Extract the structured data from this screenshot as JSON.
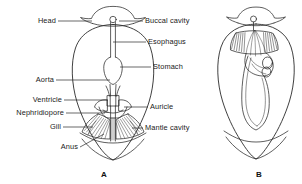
{
  "figure": {
    "background_color": "#ffffff",
    "line_color": "#2a2a2a",
    "text_color": "#1a1a1a"
  },
  "panels": [
    {
      "id": "A",
      "letter": "A",
      "caption": "A",
      "x": 101,
      "y": 171
    },
    {
      "id": "B",
      "letter": "B",
      "caption": "B",
      "x": 256,
      "y": 171
    }
  ],
  "labels_left": [
    {
      "name": "head",
      "text": "Head",
      "x": 31,
      "y": 18,
      "line_from_x": 58,
      "line_to_x": 92,
      "line_y": 21
    },
    {
      "name": "aorta",
      "text": "Aorta",
      "x": 29,
      "y": 77,
      "line_from_x": 56,
      "line_to_x": 110,
      "line_y": 80
    },
    {
      "name": "ventricle",
      "text": "Ventricle",
      "x": 19,
      "y": 97,
      "line_from_x": 62,
      "line_to_x": 108,
      "line_y": 100
    },
    {
      "name": "nephridiopore",
      "text": "Nephridiopore",
      "x": 2,
      "y": 110,
      "line_from_x": 64,
      "line_to_x": 104,
      "line_y": 113
    },
    {
      "name": "gill",
      "text": "Gill",
      "x": 48,
      "y": 124,
      "line_from_x": 63,
      "line_to_x": 92,
      "line_y": 127
    },
    {
      "name": "anus",
      "text": "Anus",
      "x": 56,
      "y": 144,
      "line_from_x": 80,
      "line_to_x": 110,
      "line_y": 147
    }
  ],
  "labels_right": [
    {
      "name": "buccal-cavity",
      "text": "Buccal cavity",
      "x": 145,
      "y": 18,
      "line_from_x": 119,
      "line_to_x": 143,
      "line_y": 21
    },
    {
      "name": "esophagus",
      "text": "Esophagus",
      "x": 148,
      "y": 39,
      "line_from_x": 115,
      "line_to_x": 146,
      "line_y": 42
    },
    {
      "name": "stomach",
      "text": "Stomach",
      "x": 153,
      "y": 64,
      "line_from_x": 122,
      "line_to_x": 151,
      "line_y": 67
    },
    {
      "name": "auricle",
      "text": "Auricle",
      "x": 150,
      "y": 104,
      "line_from_x": 124,
      "line_to_x": 148,
      "line_y": 107
    },
    {
      "name": "mantle-cavity",
      "text": "Mantle cavity",
      "x": 145,
      "y": 125,
      "line_from_x": 131,
      "line_to_x": 143,
      "line_y": 128
    }
  ]
}
